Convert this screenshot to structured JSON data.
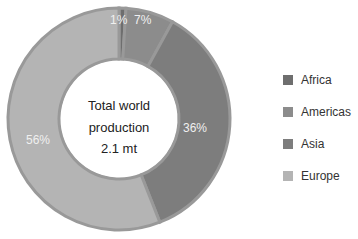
{
  "chart_data": {
    "type": "pie",
    "subtype": "donut",
    "title": "",
    "center_label": [
      "Total world",
      "production",
      "2.1 mt"
    ],
    "categories": [
      "Africa",
      "Americas",
      "Asia",
      "Europe"
    ],
    "values": [
      1,
      7,
      36,
      56
    ],
    "value_labels": [
      "1%",
      "7%",
      "36%",
      "56%"
    ],
    "colors": [
      "#6e6e6e",
      "#8c8c8c",
      "#7d7d7d",
      "#b4b4b4"
    ],
    "legend_position": "right",
    "start_angle": "top, clockwise"
  },
  "center": {
    "line1": "Total world",
    "line2": "production",
    "line3": "2.1 mt"
  },
  "legend": [
    {
      "label": "Africa",
      "color": "#6e6e6e"
    },
    {
      "label": "Americas",
      "color": "#8c8c8c"
    },
    {
      "label": "Asia",
      "color": "#7d7d7d"
    },
    {
      "label": "Europe",
      "color": "#b4b4b4"
    }
  ],
  "labels": {
    "africa": "1%",
    "americas": "7%",
    "asia": "36%",
    "europe": "56%"
  }
}
